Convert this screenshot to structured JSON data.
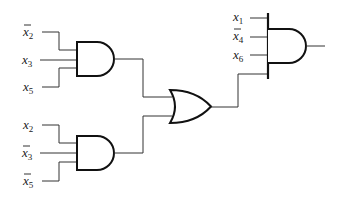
{
  "diagram": {
    "type": "logic-circuit",
    "gates": [
      {
        "id": "and1",
        "kind": "AND",
        "inputs": [
          "x̄2",
          "x3",
          "x5"
        ]
      },
      {
        "id": "and2",
        "kind": "AND",
        "inputs": [
          "x2",
          "x̄3",
          "x̄5"
        ]
      },
      {
        "id": "or1",
        "kind": "OR",
        "inputs": [
          "and1",
          "and2"
        ]
      },
      {
        "id": "and3",
        "kind": "AND",
        "inputs": [
          "x1",
          "x̄4",
          "x6",
          "or1"
        ]
      }
    ],
    "labels": {
      "g1_in1": {
        "var": "x",
        "sub": "2",
        "bar": true
      },
      "g1_in2": {
        "var": "x",
        "sub": "3",
        "bar": false
      },
      "g1_in3": {
        "var": "x",
        "sub": "5",
        "bar": false
      },
      "g2_in1": {
        "var": "x",
        "sub": "2",
        "bar": false
      },
      "g2_in2": {
        "var": "x",
        "sub": "3",
        "bar": true
      },
      "g2_in3": {
        "var": "x",
        "sub": "5",
        "bar": true
      },
      "g4_in1": {
        "var": "x",
        "sub": "1",
        "bar": false
      },
      "g4_in2": {
        "var": "x",
        "sub": "4",
        "bar": true
      },
      "g4_in3": {
        "var": "x",
        "sub": "6",
        "bar": false
      }
    }
  }
}
